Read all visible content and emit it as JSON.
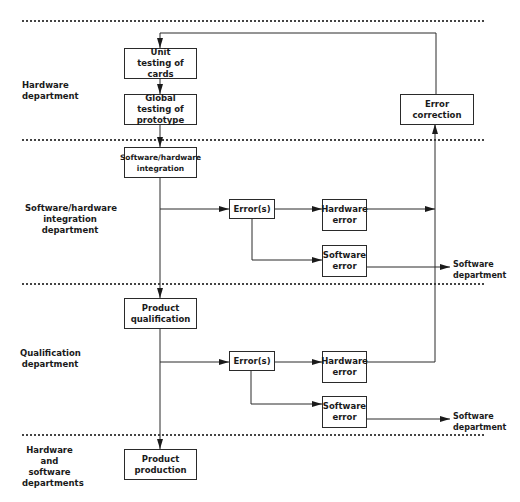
{
  "lanes": [
    {
      "label": "Hardware department"
    },
    {
      "label": "Software/hardware integration department"
    },
    {
      "label": "Qualification department"
    },
    {
      "label": "Hardware and software departments"
    }
  ],
  "boxes": {
    "unit_testing": "Unit testing of cards",
    "global_testing": "Global testing of prototype",
    "error_correction": "Error correction",
    "sw_hw_integration": "Software/hardware integration",
    "integration_errors": "Error(s)",
    "integration_hw_error": "Hardware error",
    "integration_sw_error": "Software error",
    "product_qualification": "Product qualification",
    "qualification_errors": "Error(s)",
    "qualification_hw_error": "Hardware error",
    "qualification_sw_error": "Software error",
    "product_production": "Product production"
  },
  "outputs": {
    "integration_sw_dept": "Software department",
    "qualification_sw_dept": "Software department"
  }
}
